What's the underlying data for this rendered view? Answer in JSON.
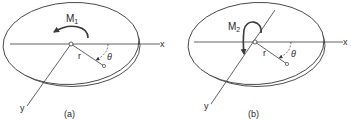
{
  "figure": {
    "panels": [
      {
        "id": "a",
        "caption": "(a)",
        "moment_label": "M",
        "moment_subscript": "1",
        "radius_label": "r",
        "angle_label": "θ",
        "x_axis_label": "x",
        "y_axis_label": "y",
        "moment_direction": "in-plane rotation about disk center (counterclockwise arrow in disk plane)"
      },
      {
        "id": "b",
        "caption": "(b)",
        "moment_label": "M",
        "moment_subscript": "2",
        "radius_label": "r",
        "angle_label": "θ",
        "x_axis_label": "x",
        "y_axis_label": "y",
        "moment_direction": "moment about the x axis (looped arrow around y axis line)"
      }
    ],
    "colors": {
      "line": "#3a3a3a",
      "background": "#ffffff"
    }
  }
}
